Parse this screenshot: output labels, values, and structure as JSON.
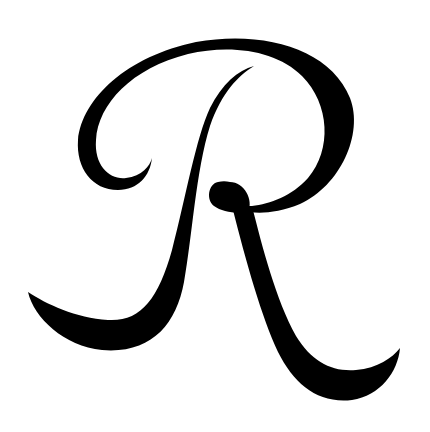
{
  "image": {
    "subject": "script letter R",
    "letter": "R",
    "colors": {
      "ink": "#000000",
      "background": "#ffffff"
    }
  }
}
